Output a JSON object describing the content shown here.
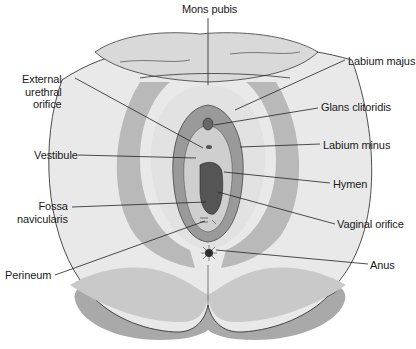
{
  "diagram": {
    "colors": {
      "background": "#ffffff",
      "skin_light": "#e9e9e9",
      "skin_mid": "#c9c9c9",
      "skin_dark": "#a9a9a9",
      "mucosa": "#8c8c8c",
      "orifice": "#5a5a5a",
      "line": "#222222"
    },
    "labels": {
      "mons_pubis": "Mons pubis",
      "external_urethral_orifice": "External\nurethral\norifice",
      "vestibule": "Vestibule",
      "fossa_navicularis": "Fossa\nnavicularis",
      "perineum": "Perineum",
      "labium_majus": "Labium majus",
      "glans_clitoridis": "Glans clitoridis",
      "labium_minus": "Labium minus",
      "hymen": "Hymen",
      "vaginal_orifice": "Vaginal orifice",
      "anus": "Anus"
    }
  }
}
